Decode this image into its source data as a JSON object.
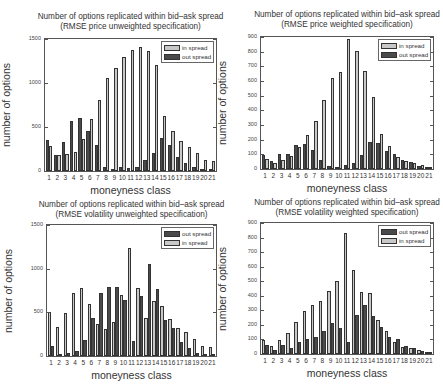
{
  "chart_data": [
    {
      "type": "bar",
      "title": "Number of options replicated within bid–ask spread",
      "subtitle": "(RMSE price unweighted specification)",
      "xlabel": "moneyness class",
      "ylabel": "number of options",
      "ylim": [
        0,
        1500
      ],
      "yticks": [
        0,
        500,
        1000,
        1500
      ],
      "categories": [
        "1",
        "2",
        "3",
        "4",
        "5",
        "6",
        "7",
        "8",
        "9",
        "10",
        "11",
        "12",
        "13",
        "14",
        "15",
        "16",
        "17",
        "18",
        "19",
        "20",
        "21"
      ],
      "legend_position": "upper right",
      "series": [
        {
          "name": "in spread",
          "color": "#c8c8c8",
          "values": [
            280,
            180,
            190,
            220,
            360,
            590,
            810,
            1060,
            1170,
            1300,
            1380,
            1410,
            1360,
            1200,
            630,
            450,
            340,
            270,
            200,
            130,
            110
          ]
        },
        {
          "name": "out spread",
          "color": "#4a4a4a",
          "values": [
            350,
            180,
            330,
            570,
            600,
            450,
            290,
            50,
            20,
            40,
            30,
            50,
            130,
            200,
            370,
            300,
            160,
            90,
            50,
            20,
            10
          ]
        }
      ],
      "legend_order": [
        "in spread",
        "out spread"
      ],
      "dark_first": true
    },
    {
      "type": "bar",
      "title": "Number of options replicated within bid–ask spread",
      "subtitle": "(RMSE price weighted specification)",
      "xlabel": "moneyness class",
      "ylabel": "number of options",
      "ylim": [
        0,
        900
      ],
      "yticks": [
        0,
        100,
        200,
        300,
        400,
        500,
        600,
        700,
        800,
        900
      ],
      "categories": [
        "1",
        "2",
        "3",
        "4",
        "5",
        "6",
        "7",
        "8",
        "9",
        "10",
        "11",
        "12",
        "13",
        "14",
        "15",
        "16",
        "17",
        "18",
        "19",
        "20",
        "21"
      ],
      "legend_position": "upper right",
      "series": [
        {
          "name": "in spread",
          "color": "#c8c8c8",
          "values": [
            70,
            40,
            60,
            90,
            150,
            235,
            330,
            470,
            620,
            660,
            885,
            805,
            670,
            490,
            240,
            155,
            80,
            55,
            40,
            30,
            15
          ]
        },
        {
          "name": "out spread",
          "color": "#4a4a4a",
          "values": [
            95,
            55,
            100,
            105,
            165,
            170,
            130,
            60,
            20,
            15,
            25,
            40,
            95,
            185,
            180,
            120,
            100,
            60,
            45,
            20,
            15
          ]
        }
      ],
      "legend_order": [
        "in spread",
        "out spread"
      ],
      "dark_first": true
    },
    {
      "type": "bar",
      "title": "Number of options replicated within bid–ask spread",
      "subtitle": "(RMSE volatility unweighted specification)",
      "xlabel": "moneyness class",
      "ylabel": "number of options",
      "ylim": [
        0,
        1500
      ],
      "yticks": [
        0,
        500,
        1000,
        1500
      ],
      "categories": [
        "1",
        "2",
        "3",
        "4",
        "5",
        "6",
        "7",
        "8",
        "9",
        "10",
        "11",
        "12",
        "13",
        "14",
        "15",
        "16",
        "17",
        "18",
        "19",
        "20",
        "21"
      ],
      "legend_position": "upper right",
      "series": [
        {
          "name": "out spread",
          "color": "#4a4a4a",
          "values": [
            120,
            20,
            30,
            60,
            180,
            430,
            720,
            790,
            790,
            640,
            170,
            690,
            1050,
            770,
            410,
            320,
            160,
            90,
            40,
            20,
            15
          ]
        },
        {
          "name": "in spread",
          "color": "#c8c8c8",
          "values": [
            500,
            330,
            490,
            720,
            780,
            600,
            370,
            310,
            390,
            700,
            1240,
            780,
            430,
            630,
            570,
            420,
            320,
            270,
            200,
            120,
            100
          ]
        }
      ],
      "legend_order": [
        "out spread",
        "in spread"
      ],
      "dark_first": false
    },
    {
      "type": "bar",
      "title": "Number of options replicated within bid–ask spread",
      "subtitle": "(RMSE volatility weighted specification)",
      "xlabel": "moneyness class",
      "ylabel": "number of options",
      "ylim": [
        0,
        900
      ],
      "yticks": [
        0,
        100,
        200,
        300,
        400,
        500,
        600,
        700,
        800,
        900
      ],
      "categories": [
        "1",
        "2",
        "3",
        "4",
        "5",
        "6",
        "7",
        "8",
        "9",
        "10",
        "11",
        "12",
        "13",
        "14",
        "15",
        "16",
        "17",
        "18",
        "19",
        "20",
        "21"
      ],
      "legend_position": "upper right",
      "series": [
        {
          "name": "out spread",
          "color": "#4a4a4a",
          "values": [
            60,
            30,
            60,
            40,
            80,
            100,
            120,
            160,
            210,
            180,
            80,
            265,
            340,
            260,
            185,
            120,
            100,
            55,
            40,
            20,
            12
          ]
        },
        {
          "name": "in spread",
          "color": "#c8c8c8",
          "values": [
            95,
            55,
            95,
            145,
            220,
            295,
            335,
            365,
            430,
            500,
            830,
            580,
            425,
            420,
            235,
            155,
            80,
            50,
            40,
            25,
            15
          ]
        }
      ],
      "legend_order": [
        "out spread",
        "in spread"
      ],
      "dark_first": false
    }
  ],
  "layout": [
    {
      "left": 44,
      "top": 38,
      "width": 173,
      "height": 134,
      "title_top": 12
    },
    {
      "left": 260,
      "top": 36,
      "width": 174,
      "height": 134,
      "title_top": 10
    },
    {
      "left": 46,
      "top": 224,
      "width": 171,
      "height": 133,
      "title_top": 200
    },
    {
      "left": 260,
      "top": 222,
      "width": 174,
      "height": 133,
      "title_top": 198
    }
  ]
}
